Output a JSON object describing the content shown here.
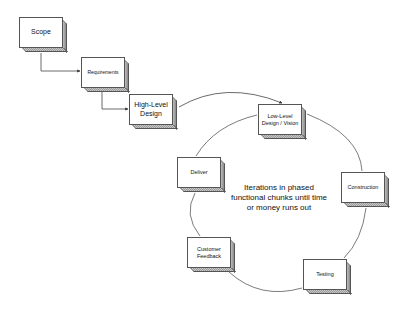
{
  "diagram": {
    "type": "process-flow",
    "nodes": [
      {
        "id": "scope",
        "label": "Scope",
        "x": 19,
        "y": 17,
        "font_size": 7
      },
      {
        "id": "requirements",
        "label": "Requirements",
        "x": 81,
        "y": 57,
        "font_size": 5
      },
      {
        "id": "high_level_design",
        "label": "High-Level Design",
        "x": 129,
        "y": 94,
        "font_size": 7
      },
      {
        "id": "low_level_design",
        "label": "Low-Level Design / Vision",
        "x": 258,
        "y": 104,
        "font_size": 5.5
      },
      {
        "id": "construction",
        "label": "Construction",
        "x": 341,
        "y": 172,
        "font_size": 5.5
      },
      {
        "id": "testing",
        "label": "Testing",
        "x": 303,
        "y": 259,
        "font_size": 5.5
      },
      {
        "id": "customer_feedback",
        "label": "Customer Feedback",
        "x": 187,
        "y": 237,
        "font_size": 5.5
      },
      {
        "id": "deliver",
        "label": "Deliver",
        "x": 177,
        "y": 157,
        "font_size": 5.5
      }
    ],
    "center_note": "Iterations in phased functional chunks until time or money runs out",
    "edges": [
      {
        "from": "scope",
        "to": "requirements",
        "style": "elbow-arrow"
      },
      {
        "from": "requirements",
        "to": "high_level_design",
        "style": "elbow-arrow"
      },
      {
        "from": "high_level_design",
        "to": "low_level_design",
        "style": "arc-arrow"
      },
      {
        "from": "low_level_design",
        "to": "construction",
        "style": "arc"
      },
      {
        "from": "construction",
        "to": "testing",
        "style": "arc"
      },
      {
        "from": "testing",
        "to": "customer_feedback",
        "style": "arc"
      },
      {
        "from": "customer_feedback",
        "to": "deliver",
        "style": "arc"
      },
      {
        "from": "deliver",
        "to": "low_level_design",
        "style": "arc"
      }
    ],
    "colors": {
      "line": "#444444",
      "box_border": "#555555",
      "box_fill": "#ffffff",
      "shadow": "#9a9a9a"
    }
  }
}
